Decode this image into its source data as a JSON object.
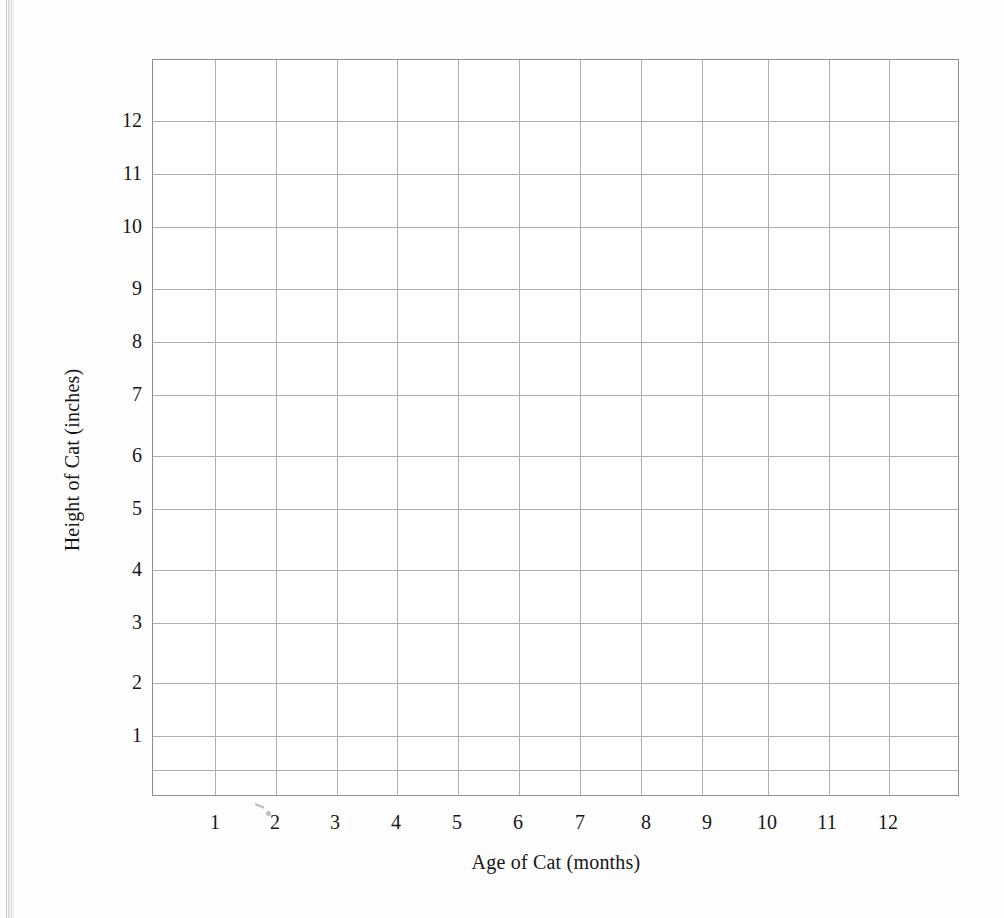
{
  "document": {
    "kind": "worksheet-blank-graph",
    "background_color": "#fefefe"
  },
  "chart_data": {
    "type": "scatter",
    "title": "",
    "subtitle": "",
    "xlabel": "Age of Cat (months)",
    "ylabel": "Height of Cat (inches)",
    "x": [],
    "values": [],
    "series": [],
    "xticks": [
      1,
      2,
      3,
      4,
      5,
      6,
      7,
      8,
      9,
      10,
      11,
      12
    ],
    "yticks": [
      1,
      2,
      3,
      4,
      5,
      6,
      7,
      8,
      9,
      10,
      11,
      12
    ],
    "xticklabels": [
      "1",
      "2",
      "3",
      "4",
      "5",
      "6",
      "7",
      "8",
      "9",
      "10",
      "11",
      "12"
    ],
    "yticklabels": [
      "1",
      "2",
      "3",
      "4",
      "5",
      "6",
      "7",
      "8",
      "9",
      "10",
      "11",
      "12"
    ],
    "xlim": [
      0,
      13
    ],
    "ylim": [
      0,
      13.9
    ],
    "grid": true,
    "grid_color": "#b0b0b0",
    "border_color": "#8d8d8d",
    "legend": null,
    "legend_position": "none",
    "annotations": [],
    "note": "Empty plotting grid — no data points, lines, or bars are drawn.",
    "grid_columns": 13,
    "grid_rows": 14
  },
  "axes": {
    "x_title": "Age of Cat (months)",
    "y_title": "Height of Cat (inches)"
  },
  "ticks": {
    "x": [
      {
        "label": "1",
        "px": 215
      },
      {
        "label": "2",
        "px": 275
      },
      {
        "label": "3",
        "px": 335
      },
      {
        "label": "4",
        "px": 396
      },
      {
        "label": "5",
        "px": 457
      },
      {
        "label": "6",
        "px": 518
      },
      {
        "label": "7",
        "px": 580
      },
      {
        "label": "8",
        "px": 646
      },
      {
        "label": "9",
        "px": 707
      },
      {
        "label": "10",
        "px": 767
      },
      {
        "label": "11",
        "px": 827
      },
      {
        "label": "12",
        "px": 888
      }
    ],
    "y": [
      {
        "label": "12",
        "px": 120
      },
      {
        "label": "11",
        "px": 173
      },
      {
        "label": "10",
        "px": 226
      },
      {
        "label": "9",
        "px": 288
      },
      {
        "label": "8",
        "px": 341
      },
      {
        "label": "7",
        "px": 394
      },
      {
        "label": "6",
        "px": 455
      },
      {
        "label": "5",
        "px": 508
      },
      {
        "label": "4",
        "px": 569
      },
      {
        "label": "3",
        "px": 622
      },
      {
        "label": "2",
        "px": 682
      },
      {
        "label": "1",
        "px": 735
      }
    ]
  },
  "grid_geometry": {
    "left": 152,
    "top": 59,
    "width": 807,
    "height": 737,
    "v_lines": [
      62,
      123,
      184,
      244,
      305,
      366,
      427,
      488,
      549,
      615,
      676,
      736
    ],
    "h_lines": [
      61,
      114,
      167,
      229,
      282,
      335,
      396,
      449,
      510,
      563,
      623,
      676,
      710
    ]
  }
}
